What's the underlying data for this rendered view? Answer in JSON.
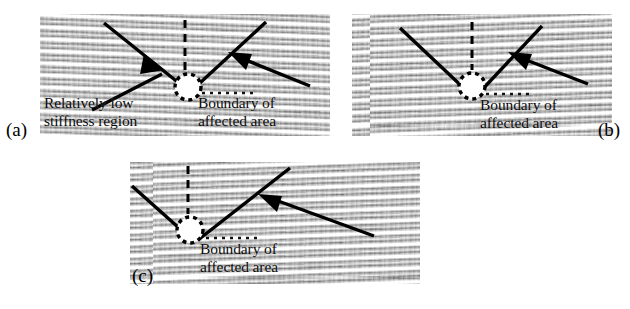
{
  "figure": {
    "type": "scientific-figure",
    "background_color": "#ffffff",
    "annotation_color": "#000000",
    "panel_tone": "#c9c9c9"
  },
  "panels": [
    {
      "id": "a",
      "sublabel": "(a)",
      "annotations": [
        {
          "name": "low-stiffness",
          "line1": "Relatively low",
          "line2": "stiffness region"
        },
        {
          "name": "boundary",
          "line1": "Boundary of",
          "line2": "affected area"
        }
      ],
      "markers": {
        "lesion_circle": "dashed-circle",
        "vertical_guide": "dashed-line",
        "arrows": 2
      }
    },
    {
      "id": "b",
      "sublabel": "(b)",
      "annotations": [
        {
          "name": "boundary",
          "line1": "Boundary of",
          "line2": "affected area"
        }
      ],
      "markers": {
        "lesion_circle": "dashed-circle",
        "vertical_guide": "dashed-line",
        "arrows": 1
      }
    },
    {
      "id": "c",
      "sublabel": "(c)",
      "annotations": [
        {
          "name": "boundary",
          "line1": "Boundary of",
          "line2": "affected area"
        }
      ],
      "markers": {
        "lesion_circle": "dashed-circle",
        "vertical_guide": "dashed-line",
        "arrows": 1
      }
    }
  ]
}
